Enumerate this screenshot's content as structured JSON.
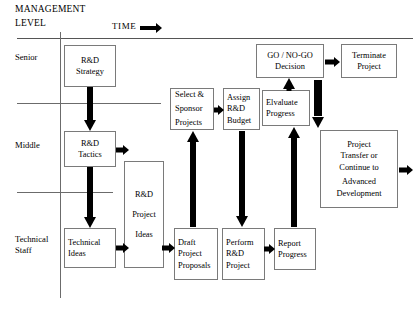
{
  "header": {
    "management": "MANAGEMENT",
    "level": "LEVEL",
    "time": "TIME",
    "time_arrow_icon": "arrow-right-icon"
  },
  "lanes": [
    {
      "id": "senior",
      "label": "Senior"
    },
    {
      "id": "middle",
      "label": "Middle"
    },
    {
      "id": "technical",
      "label_line1": "Technical",
      "label_line2": "Staff"
    }
  ],
  "nodes": {
    "rd_strategy": {
      "line1": "R&D",
      "line2": "Strategy"
    },
    "rd_tactics": {
      "line1": "R&D",
      "line2": "Tactics"
    },
    "technical_ideas": {
      "line1": "Technical",
      "line2": "Ideas"
    },
    "rd_project_ideas": {
      "line1": "R&D",
      "line2": "Project",
      "line3": "Ideas"
    },
    "draft_project_proposals": {
      "line1": "Draft",
      "line2": "Project",
      "line3": "Proposals"
    },
    "select_sponsor_projects": {
      "line1": "Select &",
      "line2": "Sponsor",
      "line3": "Projects"
    },
    "assign_rd_budget": {
      "line1": "Assign",
      "line2": "R&D",
      "line3": "Budget"
    },
    "perform_rd_project": {
      "line1": "Perform",
      "line2": "R&D",
      "line3": "Project"
    },
    "report_progress": {
      "line1": "Report",
      "line2": "Progress"
    },
    "evaluate_progress": {
      "line1": "Elvaluate",
      "line2": "Progress"
    },
    "go_no_go_decision": {
      "line1": "GO / NO-GO",
      "line2": "Decision"
    },
    "terminate_project": {
      "line1": "Terminate",
      "line2": "Project"
    },
    "project_transfer": {
      "line1": "Project",
      "line2": "Transfer or",
      "line3": "Continue to",
      "line4": "Advanced",
      "line5": "Development"
    }
  },
  "arrows": {
    "strategy_to_tactics": "arrow-down-icon",
    "tactics_to_technical_ideas": "arrow-down-icon",
    "tactics_to_ideas_box": "arrow-right-icon",
    "technical_ideas_to_ideas_box": "arrow-right-icon",
    "ideas_box_to_draft": "arrow-right-icon",
    "draft_to_select": "arrow-up-icon",
    "select_to_assign": "arrow-right-icon",
    "assign_to_perform": "arrow-down-icon",
    "perform_to_report": "arrow-right-icon",
    "report_to_evaluate": "arrow-up-icon",
    "evaluate_to_decision": "arrow-up-icon",
    "decision_to_terminate": "arrow-right-icon",
    "decision_to_transfer": "arrow-down-icon",
    "transfer_out": "arrow-right-icon"
  },
  "colors": {
    "arrow": "#000000",
    "box_border": "#7a7a7a",
    "rule": "#6b6b6b",
    "background": "#ffffff"
  }
}
